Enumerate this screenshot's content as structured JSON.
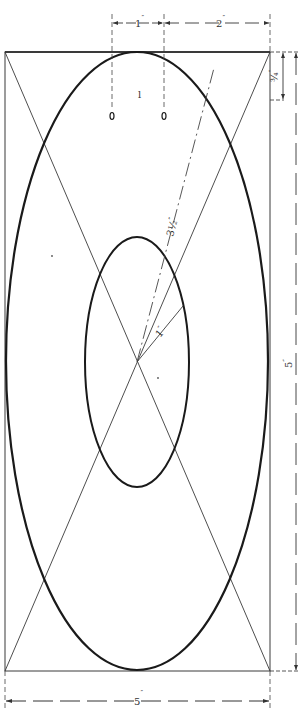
{
  "diagram": {
    "type": "technical-drawing",
    "colors": {
      "ink": "#1a1a1a",
      "thin_line": "#3a3a3a",
      "dashed_line": "#444444",
      "background": "#ffffff"
    },
    "dimensions": {
      "top_left": {
        "value": "1",
        "unit": "″"
      },
      "top_right": {
        "value": "2",
        "unit": "″"
      },
      "right_small": {
        "value": "¾",
        "unit": "″"
      },
      "right_height": {
        "value": "5",
        "unit": "″"
      },
      "bottom_width": {
        "value": "5",
        "unit": "″"
      },
      "outer_radius": {
        "value": "3½",
        "unit": "″"
      },
      "inner_radius": {
        "value": "1",
        "unit": "″"
      }
    },
    "marks": {
      "hole_label": "l",
      "hole_count": 2
    }
  }
}
